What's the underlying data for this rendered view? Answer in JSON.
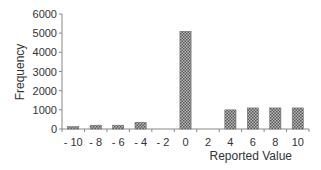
{
  "chart_data": {
    "type": "bar",
    "title": "",
    "xlabel": "Reported Value",
    "ylabel": "Frequency",
    "ylim": [
      0,
      6000
    ],
    "yticks": [
      0,
      1000,
      2000,
      3000,
      4000,
      5000,
      6000
    ],
    "categories": [
      "-10",
      "-8",
      "-6",
      "-4",
      "-2",
      "0",
      "2",
      "4",
      "6",
      "8",
      "10"
    ],
    "values": [
      130,
      200,
      200,
      350,
      0,
      5100,
      0,
      1000,
      1100,
      1100,
      1100
    ],
    "grid": false,
    "legend": null,
    "bar_fill": "checkered gray pattern"
  },
  "colors": {
    "bar_dark": "#555555",
    "bar_light": "#bbbbbb",
    "axis": "#888888"
  }
}
